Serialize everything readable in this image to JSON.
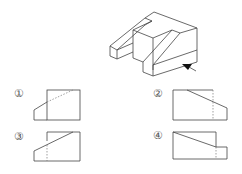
{
  "question": {
    "figure": "isometric-solid",
    "view_arrow_icon": "view-direction-arrow"
  },
  "options": [
    {
      "label": "①",
      "description": "front view option 1"
    },
    {
      "label": "②",
      "description": "front view option 2"
    },
    {
      "label": "③",
      "description": "front view option 3"
    },
    {
      "label": "④",
      "description": "front view option 4"
    }
  ],
  "colors": {
    "line": "#444444",
    "hidden_line": "#777777",
    "background": "#ffffff"
  }
}
